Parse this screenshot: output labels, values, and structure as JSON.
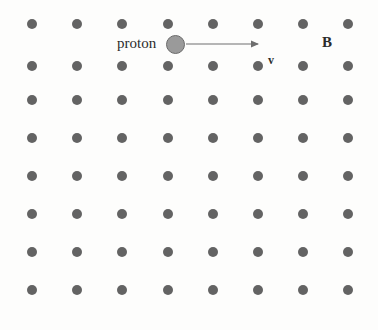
{
  "figure": {
    "background_color": "#fdfdfc",
    "width": 378,
    "height": 330
  },
  "labels": {
    "proton": "proton",
    "velocity": "v",
    "field": "B"
  },
  "colors": {
    "dot": "#636363",
    "proton_fill": "#9a9a9a",
    "proton_stroke": "#6b6b6b",
    "arrow": "#6e6e6e",
    "text": "#2b2b2b"
  },
  "field_grid": {
    "symbol": "dot-out-of-page",
    "rows": 8,
    "columns": 8,
    "dot_diameter": 10,
    "column_x": [
      32,
      77,
      122,
      168,
      213,
      258,
      303,
      348
    ],
    "row_y": [
      24,
      66,
      100,
      138,
      176,
      214,
      252,
      290
    ]
  },
  "proton": {
    "name": "proton",
    "x": 175,
    "y": 44,
    "diameter": 19
  },
  "velocity_vector": {
    "name": "v",
    "direction": "right",
    "x_start": 186,
    "x_end": 262,
    "y": 44
  }
}
